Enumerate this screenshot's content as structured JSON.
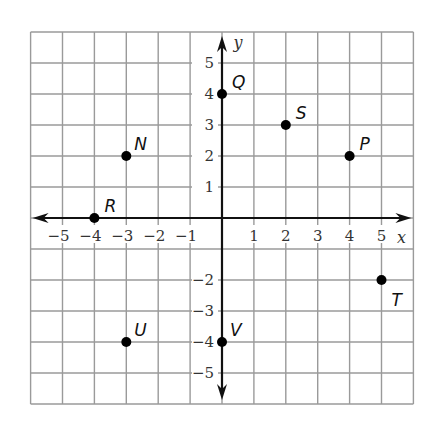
{
  "chart_data": {
    "type": "scatter",
    "title": "",
    "xlabel": "x",
    "ylabel": "y",
    "xlim": [
      -6,
      6
    ],
    "ylim": [
      -6,
      6
    ],
    "grid": true,
    "x_ticks": [
      -5,
      -4,
      -3,
      -2,
      -1,
      1,
      2,
      3,
      4,
      5
    ],
    "y_ticks": [
      5,
      4,
      3,
      2,
      1,
      -2,
      -3,
      -4,
      -5
    ],
    "points": [
      {
        "label": "Q",
        "x": 0,
        "y": 4,
        "label_dx": 10,
        "label_dy": -12
      },
      {
        "label": "S",
        "x": 2,
        "y": 3,
        "label_dx": 10,
        "label_dy": -12
      },
      {
        "label": "P",
        "x": 4,
        "y": 2,
        "label_dx": 10,
        "label_dy": -12
      },
      {
        "label": "N",
        "x": -3,
        "y": 2,
        "label_dx": 8,
        "label_dy": -12
      },
      {
        "label": "R",
        "x": -4,
        "y": 0,
        "label_dx": 10,
        "label_dy": -12
      },
      {
        "label": "T",
        "x": 5,
        "y": -2,
        "label_dx": 10,
        "label_dy": 20
      },
      {
        "label": "U",
        "x": -3,
        "y": -4,
        "label_dx": 8,
        "label_dy": -12
      },
      {
        "label": "V",
        "x": 0,
        "y": -4,
        "label_dx": 8,
        "label_dy": -12
      }
    ]
  },
  "layout": {
    "origin_px": [
      222,
      218
    ],
    "unit_x_px": 31.9,
    "unit_y_px": 31.0,
    "colors": {
      "grid": "#9a9a9a",
      "axis": "#111111",
      "point": "#000000"
    }
  }
}
